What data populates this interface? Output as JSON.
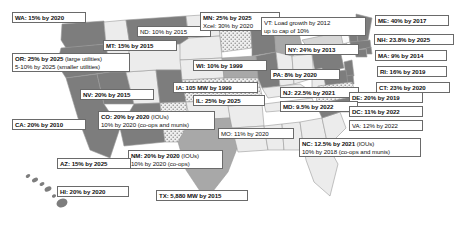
{
  "figure": {
    "type": "choropleth-map",
    "region": "United States",
    "topic": "State Renewable Portfolio Standards",
    "background_color": "#ffffff",
    "border_color": "#6a6a6a"
  },
  "map": {
    "fills": {
      "dark": "#7d7d7d",
      "medium": "#a8a8a8",
      "light": "#d6d6d6",
      "pale": "#ececec",
      "white": "#fafafa",
      "dotted_base": "#efefef",
      "dot_color": "#8a8a8a",
      "outline": "#9a9a9a"
    }
  },
  "labels": [
    {
      "id": "wa",
      "state": "WA",
      "line1": "WA: 15% by 2020",
      "line2": "",
      "note1": "",
      "note2": "",
      "x": 12,
      "y": 12,
      "w": 74,
      "bold": true
    },
    {
      "id": "nd",
      "state": "ND",
      "line1": "ND: 10% by 2015",
      "line2": "",
      "note1": "",
      "note2": "",
      "x": 137,
      "y": 26,
      "w": 74,
      "bold": false
    },
    {
      "id": "mn",
      "state": "MN",
      "line1": "MN: 25% by 2025",
      "line2": "Xcel: 30% by 2020",
      "note1": "",
      "note2": "",
      "x": 200,
      "y": 12,
      "w": 80,
      "bold": true
    },
    {
      "id": "vt",
      "state": "VT",
      "line1": "VT: Load growth by 2012",
      "line2": "up to cap of 10%",
      "note1": "",
      "note2": "",
      "x": 261,
      "y": 17,
      "w": 105,
      "bold": false
    },
    {
      "id": "me",
      "state": "ME",
      "line1": "ME: 40% by 2017",
      "line2": "",
      "note1": "",
      "note2": "",
      "x": 375,
      "y": 15,
      "w": 74,
      "bold": true
    },
    {
      "id": "mt",
      "state": "MT",
      "line1": "MT: 15% by 2015",
      "line2": "",
      "note1": "",
      "note2": "",
      "x": 103,
      "y": 40,
      "w": 74,
      "bold": true
    },
    {
      "id": "nh",
      "state": "NH",
      "line1": "NH: 23.8% by 2025",
      "line2": "",
      "note1": "",
      "note2": "",
      "x": 374,
      "y": 34,
      "w": 80,
      "bold": true
    },
    {
      "id": "ny",
      "state": "NY",
      "line1": "NY: 24% by 2013",
      "line2": "",
      "note1": "",
      "note2": "",
      "x": 285,
      "y": 44,
      "w": 74,
      "bold": true
    },
    {
      "id": "ma",
      "state": "MA",
      "line1": "MA: 9% by 2014",
      "line2": "",
      "note1": "",
      "note2": "",
      "x": 375,
      "y": 50,
      "w": 72,
      "bold": true
    },
    {
      "id": "or",
      "state": "OR",
      "line1": "OR: 25% by 2025",
      "line2": "5-10% by 2025",
      "note1": " (large utilities)",
      "note2": " (smaller utilities)",
      "x": 12,
      "y": 53,
      "w": 118,
      "bold": true
    },
    {
      "id": "wi",
      "state": "WI",
      "line1": "WI: 10% by 1999",
      "line2": "",
      "note1": "",
      "note2": "",
      "x": 193,
      "y": 60,
      "w": 74,
      "bold": true
    },
    {
      "id": "ri",
      "state": "RI",
      "line1": "RI: 16% by 2019",
      "line2": "",
      "note1": "",
      "note2": "",
      "x": 377,
      "y": 66,
      "w": 70,
      "bold": true
    },
    {
      "id": "pa",
      "state": "PA",
      "line1": "PA: 8% by 2020",
      "line2": "",
      "note1": "",
      "note2": "",
      "x": 270,
      "y": 69,
      "w": 70,
      "bold": true
    },
    {
      "id": "ia",
      "state": "IA",
      "line1": "IA: 105 MW by 1999",
      "line2": "",
      "note1": "",
      "note2": "",
      "x": 173,
      "y": 82,
      "w": 85,
      "bold": true
    },
    {
      "id": "ct",
      "state": "CT",
      "line1": "CT: 23% by 2020",
      "line2": "",
      "note1": "",
      "note2": "",
      "x": 376,
      "y": 82,
      "w": 74,
      "bold": true
    },
    {
      "id": "nv",
      "state": "NV",
      "line1": "NV: 20% by 2015",
      "line2": "",
      "note1": "",
      "note2": "",
      "x": 80,
      "y": 89,
      "w": 74,
      "bold": true
    },
    {
      "id": "nj",
      "state": "NJ",
      "line1": "NJ: 22.5% by 2021",
      "line2": "",
      "note1": "",
      "note2": "",
      "x": 280,
      "y": 87,
      "w": 79,
      "bold": true
    },
    {
      "id": "de",
      "state": "DE",
      "line1": "DE: 20% by 2019",
      "line2": "",
      "note1": "",
      "note2": "",
      "x": 349,
      "y": 92,
      "w": 74,
      "bold": true
    },
    {
      "id": "il",
      "state": "IL",
      "line1": "IL: 25% by 2025",
      "line2": "",
      "note1": "",
      "note2": "",
      "x": 193,
      "y": 95,
      "w": 72,
      "bold": true
    },
    {
      "id": "md",
      "state": "MD",
      "line1": "MD: 9.5% by 2022",
      "line2": "",
      "note1": "",
      "note2": "",
      "x": 280,
      "y": 101,
      "w": 78,
      "bold": true
    },
    {
      "id": "dc",
      "state": "DC",
      "line1": "DC: 11% by 2022",
      "line2": "",
      "note1": "",
      "note2": "",
      "x": 349,
      "y": 106,
      "w": 74,
      "bold": true
    },
    {
      "id": "ca",
      "state": "CA",
      "line1": "CA: 20% by 2010",
      "line2": "",
      "note1": "",
      "note2": "",
      "x": 12,
      "y": 119,
      "w": 74,
      "bold": true
    },
    {
      "id": "co",
      "state": "CO",
      "line1": "CO: 20% by 2020",
      "line2": "10% by 2020",
      "note1": " (IOUs)",
      "note2": " (co-ops and munis)",
      "x": 98,
      "y": 111,
      "w": 117,
      "bold": true
    },
    {
      "id": "va",
      "state": "VA",
      "line1": "VA: 12% by 2022",
      "line2": "",
      "note1": "",
      "note2": "",
      "x": 349,
      "y": 120,
      "w": 74,
      "bold": false
    },
    {
      "id": "mo",
      "state": "MO",
      "line1": "MO: 11% by 2020",
      "line2": "",
      "note1": "",
      "note2": "",
      "x": 218,
      "y": 128,
      "w": 76,
      "bold": false
    },
    {
      "id": "nc",
      "state": "NC",
      "line1": "NC: 12.5% by 2021",
      "line2": "10% by 2018",
      "note1": " (IOUs)",
      "note2": " (co-ops and munis)",
      "x": 299,
      "y": 138,
      "w": 122,
      "bold": true
    },
    {
      "id": "nm",
      "state": "NM",
      "line1": "NM: 20% by 2020",
      "line2": "10% by 2020",
      "note1": " (IOUs)",
      "note2": " (co-ops)",
      "x": 128,
      "y": 150,
      "w": 95,
      "bold": true
    },
    {
      "id": "az",
      "state": "AZ",
      "line1": "AZ: 15% by 2025",
      "line2": "",
      "note1": "",
      "note2": "",
      "x": 57,
      "y": 158,
      "w": 74,
      "bold": true
    },
    {
      "id": "hi",
      "state": "HI",
      "line1": "HI: 20% by 2020",
      "line2": "",
      "note1": "",
      "note2": "",
      "x": 57,
      "y": 186,
      "w": 72,
      "bold": true
    },
    {
      "id": "tx",
      "state": "TX",
      "line1": "TX: 5,880 MW by 2015",
      "line2": "",
      "note1": "",
      "note2": "",
      "x": 156,
      "y": 190,
      "w": 92,
      "bold": true
    }
  ]
}
